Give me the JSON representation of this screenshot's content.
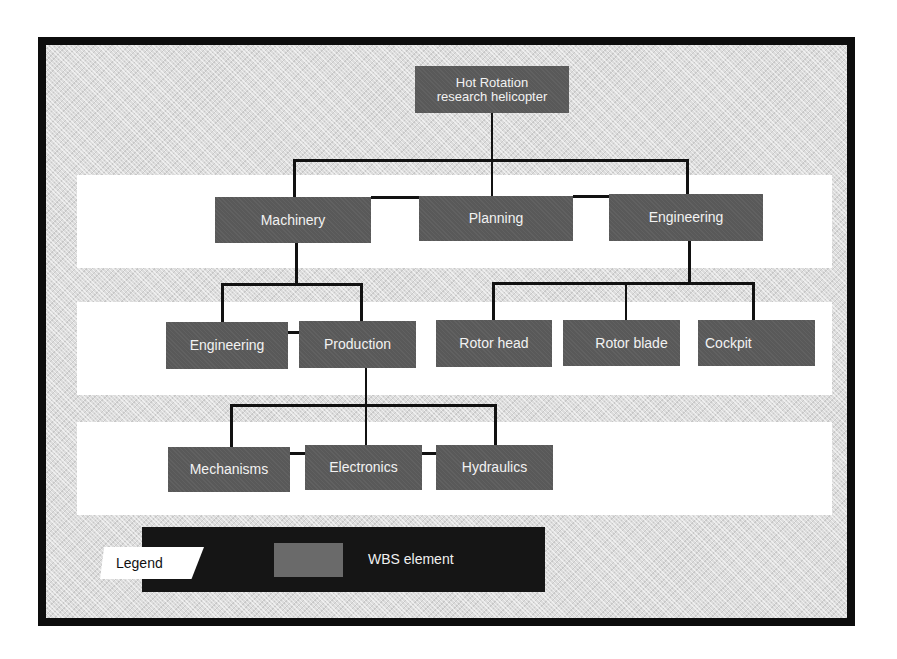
{
  "diagram": {
    "type": "work-breakdown-structure",
    "colors": {
      "frame": "#0d0d0d",
      "background": "#dcdcdc",
      "band": "#ffffff",
      "node_fill": "#595959",
      "node_text": "#f2f2f2",
      "connector": "#111111",
      "legend_bar": "#151515"
    },
    "root": {
      "line1": "Hot Rotation",
      "line2": "research helicopter"
    },
    "level2": [
      {
        "label": "Machinery"
      },
      {
        "label": "Planning"
      },
      {
        "label": "Engineering"
      }
    ],
    "level3": [
      {
        "label": "Engineering",
        "parent": "Machinery"
      },
      {
        "label": "Production",
        "parent": "Machinery"
      },
      {
        "label": "Rotor head",
        "parent": "Engineering"
      },
      {
        "label": "Rotor blade",
        "parent": "Engineering"
      },
      {
        "label": "Cockpit",
        "parent": "Engineering"
      }
    ],
    "level4": [
      {
        "label": "Mechanisms",
        "parent": "Production"
      },
      {
        "label": "Electronics",
        "parent": "Production"
      },
      {
        "label": "Hydraulics",
        "parent": "Production"
      }
    ]
  },
  "legend": {
    "title": "Legend",
    "items": [
      {
        "label": "WBS element",
        "swatch_color": "#6a6a6a"
      }
    ]
  }
}
